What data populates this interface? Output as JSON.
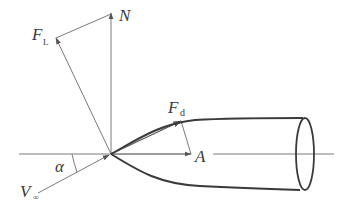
{
  "diagram": {
    "type": "force-diagram",
    "colors": {
      "thin_line": "#7a7a7a",
      "body_outline": "#3a3a3a",
      "text": "#3a3a3a",
      "background": "#ffffff"
    },
    "labels": {
      "normal_force": "N",
      "lift_force_main": "F",
      "lift_force_sub": "L",
      "drag_force_main": "F",
      "drag_force_sub": "d",
      "axial_force": "A",
      "freestream_main": "V",
      "freestream_sub": "∞",
      "angle_of_attack": "α"
    }
  }
}
